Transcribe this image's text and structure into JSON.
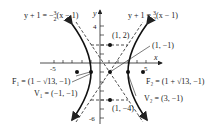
{
  "diagram": {
    "axes": {
      "x_label": "x",
      "y_label": "y",
      "x_ticks": [
        "-5",
        "5"
      ],
      "y_ticks": [
        "4",
        "-6"
      ]
    },
    "asymptotes": [
      {
        "label": "y + 1 = -3/2(x - 1)",
        "num": "3",
        "den": "2",
        "lhs": "y + 1 = −",
        "rhs": "(x − 1)"
      },
      {
        "label": "y + 1 = 3/2(x - 1)",
        "num": "3",
        "den": "2",
        "lhs": "y + 1 = ",
        "rhs": "(x − 1)"
      }
    ],
    "points": {
      "center": "(1, −1)",
      "top": "(1, 2)",
      "bottom": "(1, −4)",
      "F1": "F₁ = (1 − √13, −1)",
      "F2": "F₂ = (1 + √13, −1)",
      "V1": "V₁ = (−1, −1)",
      "V2": "V₂ = (3, −1)"
    },
    "colors": {
      "ink": "#222222",
      "background": "#ffffff"
    }
  }
}
